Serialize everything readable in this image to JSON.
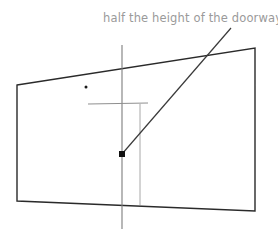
{
  "canvas": {
    "width": 278,
    "height": 230,
    "background": "#ffffff"
  },
  "annotation": {
    "label": "half the height of the doorway",
    "color": "#9a9a9a",
    "x": 103,
    "y": 11
  },
  "colors": {
    "doorway_outline": "#2a2a2a",
    "center_line": "#7d7d7d",
    "tick_line": "#8f8f8f",
    "measure_line": "#a8a8a8",
    "leader_line": "#3a3a3a",
    "marker": "#101010",
    "dot": "#1a1a1a"
  },
  "shapes": {
    "doorway_quad": {
      "name": "doorway-outline",
      "points": "17,85 255,48 255,211 17,201",
      "stroke": "#2a2a2a",
      "stroke_width": 1.4
    },
    "center_vertical_line": {
      "name": "center-vertical-line",
      "x1": 122,
      "y1": 45,
      "x2": 122,
      "y2": 229,
      "stroke": "#7d7d7d",
      "stroke_width": 1.1
    },
    "horizontal_tick_line": {
      "name": "half-height-tick-line",
      "x1": 88,
      "y1": 104,
      "x2": 148,
      "y2": 103,
      "stroke": "#8f8f8f",
      "stroke_width": 1.0
    },
    "measure_vertical_line": {
      "name": "measure-vertical-line",
      "x1": 140,
      "y1": 104,
      "x2": 140,
      "y2": 205,
      "stroke": "#a8a8a8",
      "stroke_width": 1.0
    },
    "leader_line": {
      "name": "annotation-leader-line",
      "x1": 122,
      "y1": 154,
      "x2": 231,
      "y2": 28,
      "stroke": "#3a3a3a",
      "stroke_width": 1.2
    },
    "midpoint_marker": {
      "name": "midpoint-square-marker",
      "x": 119,
      "y": 151,
      "size": 6,
      "fill": "#101010"
    },
    "reference_dot": {
      "name": "reference-dot",
      "cx": 86,
      "cy": 87,
      "r": 1.5,
      "fill": "#1a1a1a"
    }
  }
}
